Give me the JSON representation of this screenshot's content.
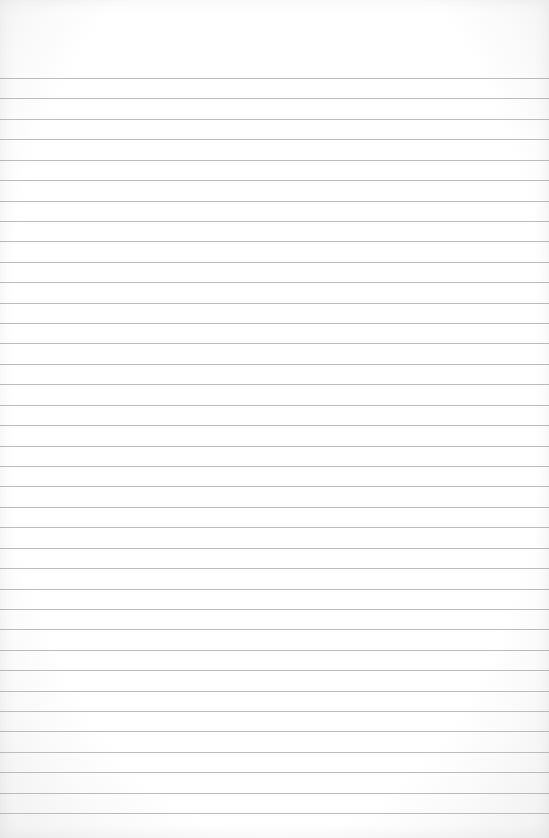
{
  "page": {
    "type": "lined-paper",
    "background_color": "#ffffff",
    "rule_color": "#bcbcbc",
    "first_rule_y": 78,
    "rule_spacing": 20.42,
    "rule_count": 37,
    "text_content": ""
  }
}
